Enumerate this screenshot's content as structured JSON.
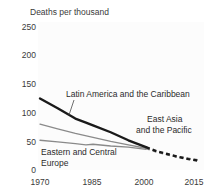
{
  "chart_data": {
    "type": "line",
    "title": "Deaths per thousand",
    "xlabel": "",
    "ylabel": "",
    "xlim": [
      1970,
      2015
    ],
    "ylim": [
      0,
      250
    ],
    "grid": false,
    "legend_position": "inline-annotations",
    "y_ticks": [
      "0",
      "50",
      "100",
      "150",
      "200",
      "250"
    ],
    "y_tick_values": [
      0,
      50,
      100,
      150,
      200,
      250
    ],
    "x_ticks": [
      "1970",
      "1985",
      "2000",
      "2015"
    ],
    "x_tick_values": [
      1970,
      1985,
      2000,
      2015
    ],
    "series": [
      {
        "name": "Latin America and the Caribbean",
        "color": "#1a1a1a",
        "width": 2.4,
        "x": [
          1970,
          1975,
          1980,
          1983,
          1985,
          1990,
          1995,
          2000
        ],
        "values": [
          125,
          108,
          90,
          83,
          78,
          66,
          52,
          40
        ],
        "projection_x": [
          2000,
          2003,
          2006,
          2009,
          2012,
          2015
        ],
        "projection_values": [
          40,
          33,
          28,
          23,
          19,
          16
        ],
        "projection_style": "dashed"
      },
      {
        "name": "East Asia and the Pacific",
        "color": "#8a8a8a",
        "width": 1.3,
        "x": [
          1970,
          1975,
          1980,
          1985,
          1990,
          1995,
          2000
        ],
        "values": [
          80,
          72,
          64,
          57,
          50,
          44,
          38
        ],
        "projection_x": [
          2000,
          2003,
          2006,
          2009,
          2012,
          2015
        ],
        "projection_values": [
          38,
          32,
          27,
          23,
          20,
          17
        ],
        "projection_style": "dashed"
      },
      {
        "name": "Eastern and Central Europe",
        "color": "#8a8a8a",
        "width": 1.3,
        "x": [
          1970,
          1975,
          1980,
          1983,
          1985,
          1990,
          1995,
          2000
        ],
        "values": [
          52,
          49,
          46,
          44,
          45,
          42,
          40,
          36
        ],
        "projection_x": [],
        "projection_values": [],
        "projection_style": "none"
      }
    ],
    "annotations": [
      {
        "id": "latin-america",
        "text": "Latin America and the Caribbean",
        "x": 66,
        "y": 97,
        "leader": true
      },
      {
        "id": "east-asia-line1",
        "text": "East Asia",
        "x": 147,
        "y": 122,
        "leader": false
      },
      {
        "id": "east-asia-line2",
        "text": "and the Pacific",
        "x": 136,
        "y": 133,
        "leader": false
      },
      {
        "id": "eastern-europe-line1",
        "text": "Eastern and Central",
        "x": 41,
        "y": 155,
        "leader": false
      },
      {
        "id": "eastern-europe-line2",
        "text": "Europe",
        "x": 41,
        "y": 166,
        "leader": false
      }
    ]
  }
}
